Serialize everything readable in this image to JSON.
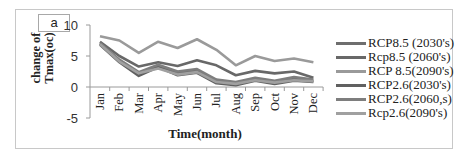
{
  "panel_label": "a",
  "chart_data": {
    "type": "line",
    "title": "",
    "xlabel": "Time(month)",
    "ylabel": "change of Tmax(oc)",
    "ylim": [
      -5,
      10
    ],
    "yticks": [
      -5,
      0,
      5,
      10
    ],
    "grid": false,
    "legend_position": "right",
    "categories": [
      "Jan",
      "Feb",
      "Mar",
      "Apr",
      "May",
      "Jun",
      "Jul",
      "Aug",
      "Sep",
      "Oct",
      "Nov",
      "Dec"
    ],
    "series": [
      {
        "name": "RCP8.5 (2030's)",
        "color": "#6e6e6e",
        "values": [
          7.0,
          4.2,
          2.0,
          3.4,
          2.2,
          2.6,
          1.0,
          0.6,
          1.2,
          0.8,
          1.3,
          1.0
        ]
      },
      {
        "name": "Rcp8.5 (2060's)",
        "color": "#686868",
        "values": [
          7.3,
          5.0,
          3.3,
          4.0,
          3.4,
          4.3,
          3.5,
          1.9,
          2.6,
          2.2,
          2.5,
          1.5
        ]
      },
      {
        "name": "RCP 8.5(2090's)",
        "color": "#9a9a9a",
        "values": [
          8.2,
          7.5,
          5.5,
          7.3,
          6.3,
          7.7,
          6.0,
          3.5,
          5.0,
          4.2,
          4.6,
          4.0
        ]
      },
      {
        "name": "RCP2.6(2030's)",
        "color": "#606060",
        "values": [
          6.8,
          4.0,
          1.8,
          3.2,
          1.9,
          2.3,
          0.6,
          0.3,
          1.0,
          0.5,
          1.0,
          0.8
        ]
      },
      {
        "name": "RCP2.6(2060,s)",
        "color": "#7e7e7e",
        "values": [
          7.1,
          4.4,
          2.4,
          3.6,
          2.5,
          2.9,
          1.2,
          0.8,
          1.5,
          1.0,
          1.6,
          1.2
        ]
      },
      {
        "name": "Rcp2.6(2090's)",
        "color": "#a0a0a0",
        "values": [
          6.9,
          4.1,
          2.2,
          3.0,
          2.0,
          2.4,
          0.8,
          0.5,
          1.1,
          0.7,
          1.1,
          0.9
        ]
      }
    ]
  }
}
